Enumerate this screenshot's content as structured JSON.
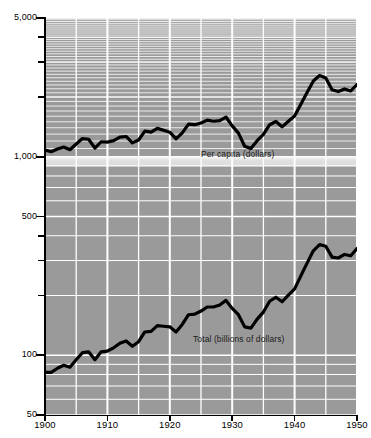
{
  "chart_data": {
    "type": "line",
    "title": "",
    "subtitle": "",
    "xlabel": "",
    "ylabel": "",
    "scale_y": "log",
    "grid": true,
    "legend_position": "inline-annotations",
    "xlim": [
      1900,
      1950
    ],
    "ylim": [
      50,
      5000
    ],
    "x_ticks": [
      1900,
      1910,
      1920,
      1930,
      1940,
      1950
    ],
    "x_tick_labels": [
      "1900",
      "1910",
      "1920",
      "1930",
      "1940",
      "1950"
    ],
    "x_minor_gridlines": [
      1905,
      1915,
      1925,
      1935,
      1945
    ],
    "y_ticks": [
      50,
      100,
      500,
      1000,
      5000
    ],
    "y_tick_labels": [
      "50",
      "100",
      "500",
      "1,000",
      "5,000"
    ],
    "y_minor_ticks": [
      200,
      300,
      400,
      2000,
      3000,
      4000
    ],
    "x": [
      1900,
      1901,
      1902,
      1903,
      1904,
      1905,
      1906,
      1907,
      1908,
      1909,
      1910,
      1911,
      1912,
      1913,
      1914,
      1915,
      1916,
      1917,
      1918,
      1919,
      1920,
      1921,
      1922,
      1923,
      1924,
      1925,
      1926,
      1927,
      1928,
      1929,
      1930,
      1931,
      1932,
      1933,
      1934,
      1935,
      1936,
      1937,
      1938,
      1939,
      1940,
      1941,
      1942,
      1943,
      1944,
      1945,
      1946,
      1947,
      1948,
      1949,
      1950
    ],
    "series": [
      {
        "name": "Per capita (dollars)",
        "label": "Per capita (dollars)",
        "color": "#000000",
        "units": "dollars",
        "values": [
          1080,
          1060,
          1095,
          1120,
          1085,
          1160,
          1235,
          1225,
          1105,
          1190,
          1185,
          1205,
          1255,
          1265,
          1175,
          1215,
          1345,
          1330,
          1390,
          1360,
          1330,
          1230,
          1320,
          1460,
          1450,
          1480,
          1530,
          1510,
          1520,
          1585,
          1430,
          1315,
          1130,
          1100,
          1205,
          1295,
          1450,
          1505,
          1415,
          1510,
          1605,
          1840,
          2110,
          2410,
          2565,
          2490,
          2175,
          2130,
          2195,
          2145,
          2310
        ]
      },
      {
        "name": "Total (billions of dollars)",
        "label": "Total (billions of dollars)",
        "color": "#000000",
        "units": "billions of dollars",
        "values": [
          82,
          82,
          86,
          89,
          87,
          95,
          103,
          104,
          95,
          104,
          105,
          109,
          115,
          118,
          111,
          117,
          131,
          132,
          141,
          140,
          139,
          131,
          143,
          160,
          161,
          167,
          175,
          175,
          179,
          189,
          172,
          160,
          139,
          137,
          152,
          165,
          187,
          196,
          186,
          201,
          216,
          251,
          291,
          336,
          361,
          354,
          312,
          309,
          322,
          317,
          345
        ]
      }
    ]
  },
  "axes": {
    "y_labels": [
      {
        "value": 5000,
        "text": "5,000"
      },
      {
        "value": 1000,
        "text": "1,000"
      },
      {
        "value": 500,
        "text": "500"
      },
      {
        "value": 100,
        "text": "100"
      },
      {
        "value": 50,
        "text": "50"
      }
    ],
    "x_labels": [
      {
        "value": 1900,
        "text": "1900"
      },
      {
        "value": 1910,
        "text": "1910"
      },
      {
        "value": 1920,
        "text": "1920"
      },
      {
        "value": 1930,
        "text": "1930"
      },
      {
        "value": 1940,
        "text": "1940"
      },
      {
        "value": 1950,
        "text": "1950"
      }
    ]
  },
  "annotations": {
    "per_capita": "Per capita (dollars)",
    "total": "Total (billions of dollars)"
  },
  "colors": {
    "plot_background": "#9a9a9a",
    "gridline": "#ffffff",
    "line": "#000000",
    "axis": "#000000",
    "page_background": "#ffffff"
  }
}
